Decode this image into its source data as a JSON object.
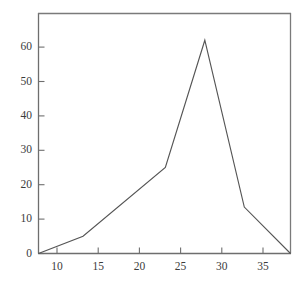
{
  "chart_data": {
    "type": "line",
    "title": "",
    "subtitle": "",
    "xlabel": "",
    "ylabel": "",
    "x": [
      7.7,
      13,
      22.8,
      27.5,
      32.2,
      37.7
    ],
    "values": [
      0,
      5,
      25,
      62,
      13.5,
      0
    ],
    "series": [
      {
        "name": "",
        "x": [
          7.7,
          13,
          22.8,
          27.5,
          32.2,
          37.7
        ],
        "values": [
          0,
          5,
          25,
          62,
          13.5,
          0
        ]
      }
    ],
    "xlim": [
      7.7,
      37.7
    ],
    "ylim": [
      0,
      69
    ],
    "xticks": [
      10,
      15,
      20,
      25,
      30,
      35
    ],
    "yticks": [
      0,
      10,
      20,
      30,
      40,
      50,
      60
    ],
    "xtick_labels": [
      "10",
      "15",
      "20",
      "25",
      "30",
      "35"
    ],
    "ytick_labels": [
      "0",
      "10",
      "20",
      "30",
      "40",
      "50",
      "60"
    ],
    "grid": false,
    "legend": null,
    "legend_position": "none",
    "annotations": [],
    "line_color": "#555555",
    "axis_color": "#6e6e6e",
    "background_color": "#ffffff",
    "text_color": "#3b3b3b"
  }
}
